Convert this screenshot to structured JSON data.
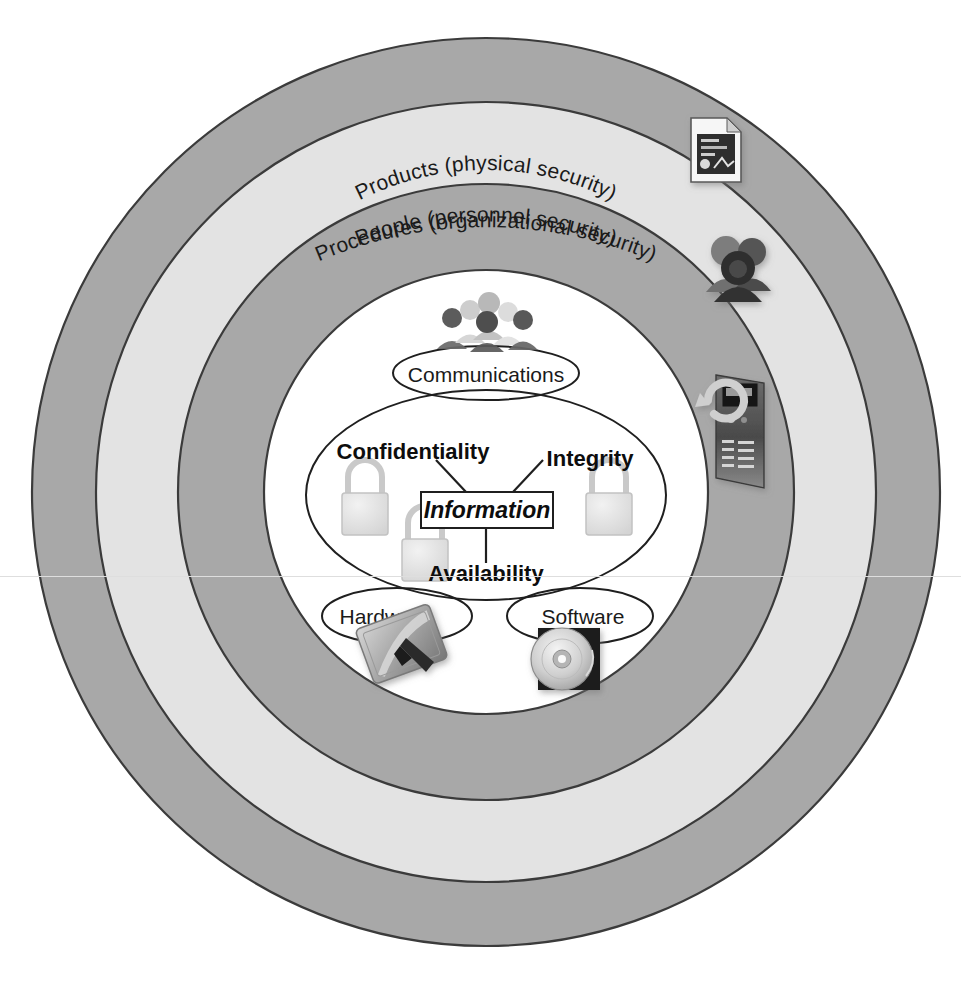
{
  "diagram": {
    "type": "concentric-rings",
    "canvas": {
      "width": 961,
      "height": 998,
      "background": "#ffffff"
    },
    "colors": {
      "ring_dark": "#a8a8a8",
      "ring_light": "#e3e3e3",
      "core": "#ffffff",
      "stroke": "#333333",
      "text": "#1a1a1a",
      "padlock": "#dcdcdc",
      "padlock_stroke": "#bdbdbd"
    },
    "rings": [
      {
        "id": "procedures",
        "label": "Procedures (organizational security)",
        "fill": "#a8a8a8",
        "outer_radius": 454,
        "inner_radius": 390,
        "icon": "document-icon",
        "icon_title": "document"
      },
      {
        "id": "people",
        "label": "People (personnel security)",
        "fill": "#e3e3e3",
        "outer_radius": 390,
        "inner_radius": 308,
        "icon": "people-group-icon",
        "icon_title": "people group"
      },
      {
        "id": "products",
        "label": "Products (physical security)",
        "fill": "#a8a8a8",
        "outer_radius": 308,
        "inner_radius": 222,
        "icon": "server-device-icon",
        "icon_title": "product device"
      },
      {
        "id": "core",
        "label": "",
        "fill": "#ffffff",
        "outer_radius": 222,
        "inner_radius": 0,
        "icon": "",
        "icon_title": ""
      }
    ],
    "core": {
      "center_node": "Information",
      "pillars": [
        {
          "id": "confidentiality",
          "label": "Confidentiality",
          "padlock": "padlock-icon"
        },
        {
          "id": "integrity",
          "label": "Integrity",
          "padlock": "padlock-icon"
        },
        {
          "id": "availability",
          "label": "Availability",
          "padlock": "padlock-icon"
        }
      ],
      "assets": [
        {
          "id": "communications",
          "label": "Communications",
          "icon": "crowd-people-icon"
        },
        {
          "id": "hardware",
          "label": "Hardware",
          "icon": "laptop-icon"
        },
        {
          "id": "software",
          "label": "Software",
          "icon": "cd-disc-icon"
        }
      ]
    }
  }
}
